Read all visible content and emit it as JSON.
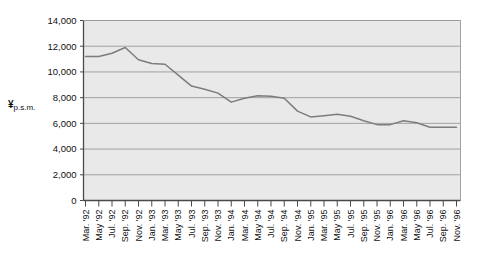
{
  "chart_data": {
    "type": "line",
    "title": "",
    "subtitle": "",
    "xlabel": "",
    "ylabel": "¥ p.s.m.",
    "ylabel_main": "¥",
    "ylabel_sub": "p.s.m.",
    "ylim": [
      0,
      14000
    ],
    "ytick_values": [
      0,
      2000,
      4000,
      6000,
      8000,
      10000,
      12000,
      14000
    ],
    "ytick_labels": [
      "0",
      "2,000",
      "4,000",
      "6,000",
      "8,000",
      "10,000",
      "12,000",
      "14,000"
    ],
    "grid": true,
    "legend": "none",
    "plot_bg_color": "#e9e9e9",
    "line_color": "#7d7d7d",
    "grid_color": "#9a9a9a",
    "axis_color": "#4a4a4a",
    "categories": [
      "Mar. '92",
      "May '92",
      "Jul. '92",
      "Sep. '92",
      "Nov. '92",
      "Jan. '93",
      "Mar. '93",
      "May '93",
      "Jul. '93",
      "Sep. '93",
      "Nov. '93",
      "Jan. '94",
      "Mar. '94",
      "May '94",
      "Jul. '94",
      "Sep. '94",
      "Nov. '94",
      "Jan. '95",
      "Mar. '95",
      "May '95",
      "Jul. '95",
      "Sep. '95",
      "Nov. '95",
      "Jan. '96",
      "Mar. '96",
      "May '96",
      "Jul. '96",
      "Sep. '96",
      "Nov. '96"
    ],
    "values": [
      11200,
      11200,
      11450,
      11900,
      10950,
      10650,
      10600,
      9750,
      8900,
      8650,
      8350,
      7650,
      7950,
      8150,
      8100,
      7950,
      6950,
      6500,
      6600,
      6700,
      6550,
      6200,
      5900,
      5900,
      6200,
      6050,
      5700,
      5700,
      5700
    ],
    "series": [
      {
        "name": "¥ p.s.m.",
        "values": [
          11200,
          11200,
          11450,
          11900,
          10950,
          10650,
          10600,
          9750,
          8900,
          8650,
          8350,
          7650,
          7950,
          8150,
          8100,
          7950,
          6950,
          6500,
          6600,
          6700,
          6550,
          6200,
          5900,
          5900,
          6200,
          6050,
          5700,
          5700,
          5700
        ]
      }
    ]
  }
}
